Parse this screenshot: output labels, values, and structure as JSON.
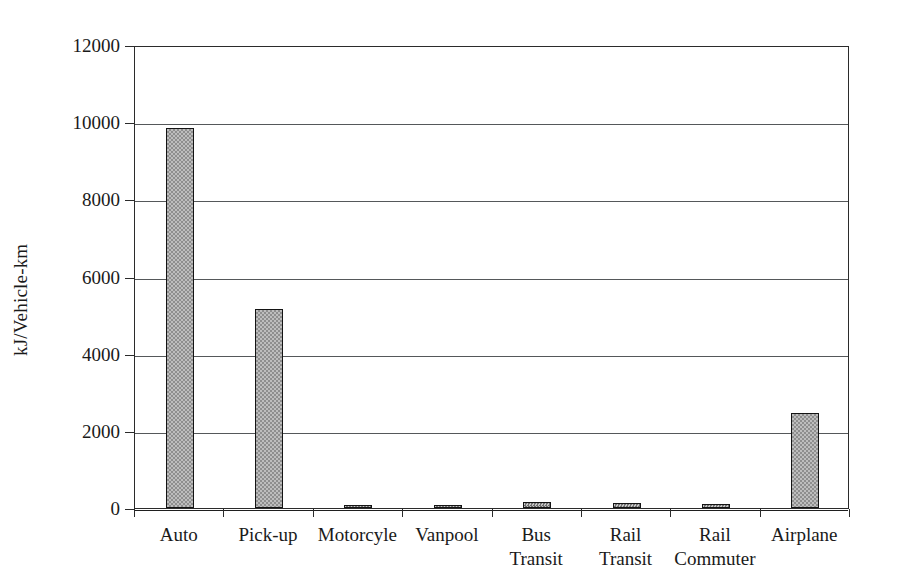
{
  "chart_data": {
    "type": "bar",
    "title": "",
    "subtitle": "",
    "xlabel": "",
    "ylabel": "kJ/Vehicle-km",
    "categories": [
      "Auto",
      "Pick-up",
      "Motorcyle",
      "Vanpool",
      "Bus Transit",
      "Rail Transit",
      "Rail Commuter",
      "Airplane"
    ],
    "category_lines": [
      [
        "Auto",
        ""
      ],
      [
        "Pick-up",
        ""
      ],
      [
        "Motorcyle",
        ""
      ],
      [
        "Vanpool",
        ""
      ],
      [
        "Bus",
        "Transit"
      ],
      [
        "Rail",
        "Transit"
      ],
      [
        "Rail",
        "Commuter"
      ],
      [
        "Airplane",
        ""
      ]
    ],
    "values": [
      9850,
      5150,
      80,
      70,
      160,
      120,
      100,
      2450
    ],
    "ylim": [
      0,
      12000
    ],
    "ytick_values": [
      0,
      2000,
      4000,
      6000,
      8000,
      10000,
      12000
    ],
    "ytick_labels": [
      "0",
      "2000",
      "4000",
      "6000",
      "8000",
      "10000",
      "12000"
    ],
    "grid": "horizontal",
    "legend": "none",
    "bar_fill_color": "#a5a5a5",
    "bar_edge_color": "#141414",
    "axis_color": "#2b2b2b",
    "grid_color": "#55585a",
    "background_color": "#ffffff"
  }
}
